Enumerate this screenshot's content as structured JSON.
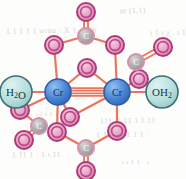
{
  "figure": {
    "background_color": "#fdfdfb",
    "bond_color": "#e8755c",
    "metal_color": "#4a86d4",
    "metal_ring_color": "#2f5fa8",
    "oxygen_fill": "#e79ec4",
    "oxygen_ring": "#b03a78",
    "carbon_fill": "#a9a9a9",
    "carbon_ring": "#d98fae",
    "water_fill": "#b7dedd",
    "water_ring": "#3c6f71"
  },
  "atoms": {
    "metals": [
      {
        "id": "cr-left",
        "label": "Cr",
        "x": 58,
        "y": 92,
        "r": 13
      },
      {
        "id": "cr-right",
        "label": "Cr",
        "x": 117,
        "y": 92,
        "r": 13
      }
    ],
    "ligands": [
      {
        "id": "water-left",
        "label": "H₂O",
        "x": 16,
        "y": 92,
        "r": 16
      },
      {
        "id": "water-right",
        "label": "OH₂",
        "x": 162,
        "y": 92,
        "r": 16
      }
    ],
    "carbons": [
      {
        "id": "c-top",
        "label": "C",
        "x": 86,
        "y": 36,
        "r": 8
      },
      {
        "id": "c-bottom",
        "label": "C",
        "x": 86,
        "y": 148,
        "r": 8
      },
      {
        "id": "c-right-upper",
        "label": "C",
        "x": 136,
        "y": 62,
        "r": 8
      },
      {
        "id": "c-left-lower",
        "label": "C",
        "x": 39,
        "y": 126,
        "r": 8
      }
    ],
    "oxygens": [
      {
        "id": "o-top-terminal",
        "label": "O",
        "x": 86,
        "y": 12,
        "r": 9
      },
      {
        "id": "o-top-left-bridge",
        "label": "O",
        "x": 54,
        "y": 45,
        "r": 9
      },
      {
        "id": "o-top-right-bridge",
        "label": "O",
        "x": 115,
        "y": 45,
        "r": 9
      },
      {
        "id": "o-inner-upper",
        "label": "O",
        "x": 87,
        "y": 68,
        "r": 9
      },
      {
        "id": "o-right-terminal",
        "label": "O",
        "x": 163,
        "y": 47,
        "r": 9
      },
      {
        "id": "o-right-bridge",
        "label": "O",
        "x": 139,
        "y": 79,
        "r": 9
      },
      {
        "id": "o-left-bridge",
        "label": "O",
        "x": 20,
        "y": 110,
        "r": 9
      },
      {
        "id": "o-left-terminal",
        "label": "O",
        "x": 24,
        "y": 140,
        "r": 9
      },
      {
        "id": "o-inner-lower",
        "label": "O",
        "x": 70,
        "y": 117,
        "r": 9
      },
      {
        "id": "o-bottom-left-bridge",
        "label": "O",
        "x": 57,
        "y": 132,
        "r": 9
      },
      {
        "id": "o-bottom-right-bridge",
        "label": "O",
        "x": 117,
        "y": 131,
        "r": 9
      },
      {
        "id": "o-bottom-terminal",
        "label": "O",
        "x": 86,
        "y": 171,
        "r": 9
      }
    ]
  },
  "bonds": {
    "metal_metal": {
      "order": 4,
      "from": "cr-left",
      "to": "cr-right",
      "label": "quadruple bond"
    },
    "single": [
      [
        "cr-left",
        "water-left"
      ],
      [
        "cr-right",
        "water-right"
      ],
      [
        "cr-left",
        "o-top-left-bridge"
      ],
      [
        "cr-right",
        "o-top-right-bridge"
      ],
      [
        "cr-left",
        "o-left-bridge"
      ],
      [
        "cr-right",
        "o-right-bridge"
      ],
      [
        "cr-left",
        "o-inner-lower"
      ],
      [
        "cr-right",
        "o-inner-upper"
      ],
      [
        "cr-left",
        "o-bottom-left-bridge"
      ],
      [
        "cr-right",
        "o-bottom-right-bridge"
      ],
      [
        "o-top-left-bridge",
        "c-top"
      ],
      [
        "o-top-right-bridge",
        "c-top"
      ],
      [
        "o-right-bridge",
        "c-right-upper"
      ],
      [
        "o-left-bridge",
        "c-left-lower"
      ],
      [
        "o-bottom-left-bridge",
        "c-bottom"
      ],
      [
        "o-bottom-right-bridge",
        "c-bottom"
      ],
      [
        "o-inner-upper",
        "cr-left"
      ],
      [
        "o-inner-lower",
        "cr-right"
      ]
    ],
    "double": [
      [
        "c-top",
        "o-top-terminal"
      ],
      [
        "c-bottom",
        "o-bottom-terminal"
      ],
      [
        "c-right-upper",
        "o-right-terminal"
      ],
      [
        "c-left-lower",
        "o-left-terminal"
      ]
    ]
  },
  "show_through_text": [
    {
      "text": "m (1,1)",
      "x": 120,
      "y": 6,
      "size": 8,
      "rotate": -2
    },
    {
      "text": "1 1 1 1 1 wınu · X 1-m Dr",
      "x": 6,
      "y": 26,
      "size": 8,
      "rotate": -1
    },
    {
      "text": "ı 1 ı χ . ı 1 2",
      "x": 150,
      "y": 28,
      "size": 8,
      "rotate": -1
    },
    {
      "text": "ı f ı 1 1 1",
      "x": 36,
      "y": 110,
      "size": 7,
      "rotate": 0
    },
    {
      "text": "111. 1.11 1 1 11",
      "x": 100,
      "y": 116,
      "size": 8,
      "rotate": -1
    },
    {
      "text": "1 11 1 1 1 1 1 ·",
      "x": 96,
      "y": 130,
      "size": 8,
      "rotate": -1
    },
    {
      "text": "1 11 1 · 1  ı  11",
      "x": 12,
      "y": 150,
      "size": 8,
      "rotate": -1
    },
    {
      "text": "ı ı 1 1 · ı",
      "x": 122,
      "y": 158,
      "size": 7,
      "rotate": 0
    }
  ]
}
